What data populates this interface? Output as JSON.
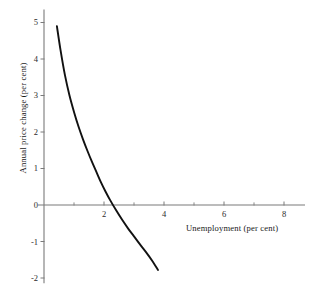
{
  "chart_data": {
    "type": "line",
    "title": "",
    "xlabel": "Unemployment (per cent)",
    "ylabel": "Annual price change (per cent)",
    "xlim": [
      0,
      8.7
    ],
    "ylim": [
      -2.2,
      5.3
    ],
    "grid": false,
    "legend": null,
    "x_major_ticks": [
      2,
      4,
      6,
      8
    ],
    "x_major_tick_labels": [
      "2",
      "4",
      "6",
      "8"
    ],
    "x_minor_ticks": [
      1,
      3,
      5,
      7
    ],
    "y_major_ticks": [
      -2,
      -1,
      0,
      1,
      2,
      3,
      4,
      5
    ],
    "y_major_tick_labels": [
      "-2",
      "-1",
      "0",
      "1",
      "2",
      "3",
      "4",
      "5"
    ],
    "series": [
      {
        "name": "Phillips curve",
        "color": "#111111",
        "linewidth": 1.9,
        "x": [
          0.43,
          0.55,
          0.7,
          0.85,
          1.0,
          1.15,
          1.3,
          1.45,
          1.6,
          1.75,
          1.9,
          2.05,
          2.2,
          2.4,
          2.6,
          2.8,
          3.0,
          3.2,
          3.4,
          3.6,
          3.8
        ],
        "y": [
          4.9,
          4.25,
          3.55,
          3.0,
          2.55,
          2.15,
          1.8,
          1.48,
          1.18,
          0.9,
          0.62,
          0.37,
          0.14,
          -0.14,
          -0.4,
          -0.64,
          -0.86,
          -1.08,
          -1.29,
          -1.52,
          -1.78
        ]
      }
    ],
    "axis_color": "#7a7a7a",
    "zero_line_value": 0,
    "curve_zero_crossing_x": 2.33
  },
  "figure": {
    "background": "#ffffff",
    "tick_label_color": "#2b2b2b"
  }
}
